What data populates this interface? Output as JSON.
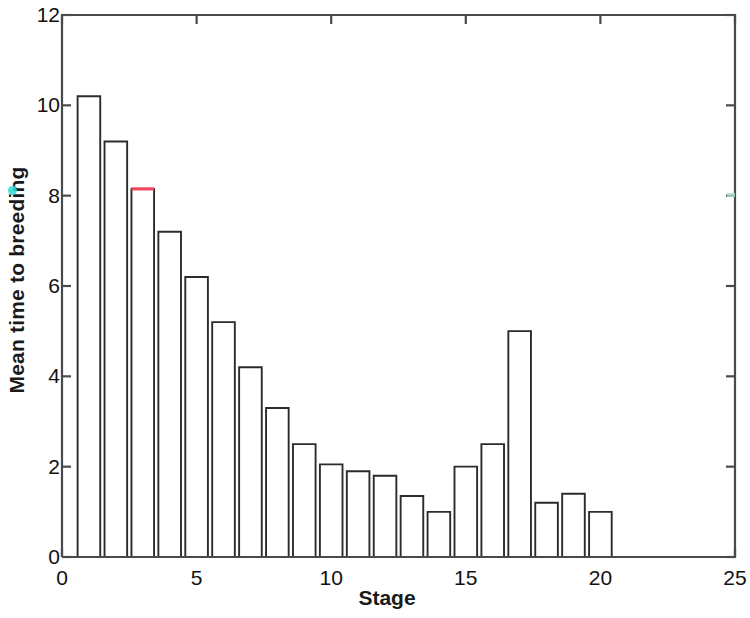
{
  "chart_data": {
    "type": "bar",
    "title": "",
    "xlabel": "Stage",
    "ylabel": "Mean time to breeding",
    "xlim": [
      0,
      25
    ],
    "ylim": [
      0,
      12
    ],
    "xticks": [
      0,
      5,
      10,
      15,
      20,
      25
    ],
    "yticks": [
      0,
      2,
      4,
      6,
      8,
      10,
      12
    ],
    "grid": false,
    "legend": null,
    "bar_face_color": "#ffffff",
    "bar_edge_color": "#2b2b2b",
    "highlight_bar_stage": 3,
    "highlight_edge_color": "#f0465e",
    "axis_color": "#4a4a4a",
    "categories": [
      1,
      2,
      3,
      4,
      5,
      6,
      7,
      8,
      9,
      10,
      11,
      12,
      13,
      14,
      15,
      16,
      17,
      18,
      19,
      20
    ],
    "values": [
      10.2,
      9.2,
      8.15,
      7.2,
      6.2,
      5.2,
      4.2,
      3.3,
      2.5,
      2.05,
      1.9,
      1.8,
      1.35,
      1.0,
      2.0,
      2.5,
      5.0,
      1.2,
      1.4,
      1.0
    ],
    "bars": [
      {
        "stage": 1,
        "value": 10.2
      },
      {
        "stage": 2,
        "value": 9.2
      },
      {
        "stage": 3,
        "value": 8.15
      },
      {
        "stage": 4,
        "value": 7.2
      },
      {
        "stage": 5,
        "value": 6.2
      },
      {
        "stage": 6,
        "value": 5.2
      },
      {
        "stage": 7,
        "value": 4.2
      },
      {
        "stage": 8,
        "value": 3.3
      },
      {
        "stage": 9,
        "value": 2.5
      },
      {
        "stage": 10,
        "value": 2.05
      },
      {
        "stage": 11,
        "value": 1.9
      },
      {
        "stage": 12,
        "value": 1.8
      },
      {
        "stage": 13,
        "value": 1.35
      },
      {
        "stage": 14,
        "value": 1.0
      },
      {
        "stage": 15,
        "value": 2.0
      },
      {
        "stage": 16,
        "value": 2.5
      },
      {
        "stage": 17,
        "value": 5.0
      },
      {
        "stage": 18,
        "value": 1.2
      },
      {
        "stage": 19,
        "value": 1.4
      },
      {
        "stage": 20,
        "value": 1.0
      }
    ]
  },
  "axes": {
    "ylabel_text": "Mean time to breeding",
    "xlabel_text": "Stage",
    "ytick_labels": [
      "0",
      "2",
      "4",
      "6",
      "8",
      "10",
      "12"
    ],
    "xtick_labels": [
      "0",
      "5",
      "10",
      "15",
      "20",
      "25"
    ]
  }
}
